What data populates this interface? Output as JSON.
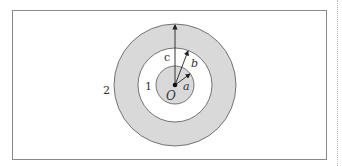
{
  "diagram": {
    "title": "",
    "center_label": "O",
    "radius_labels": {
      "inner": "a",
      "middle": "b",
      "outer": "c"
    },
    "region_labels": {
      "region_1": "1",
      "region_2": "2"
    },
    "colors": {
      "shaded": "#d9d9d9",
      "stroke": "#555555",
      "background": "#ffffff",
      "frame": "#8a8a8a"
    },
    "geometry": {
      "center_x": 175,
      "center_y": 85,
      "radius_a": 19,
      "radius_b": 37,
      "radius_c": 61
    }
  }
}
